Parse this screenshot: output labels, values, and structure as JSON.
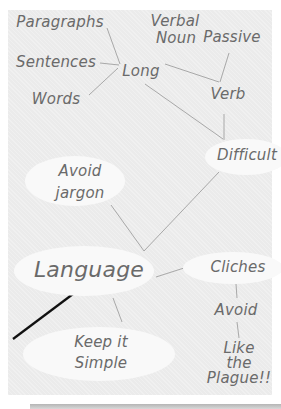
{
  "diagram": {
    "type": "mind-map",
    "central_node": "Language",
    "nodes": {
      "paragraphs": "Paragraphs",
      "sentences": "Sentences",
      "words": "Words",
      "long": "Long",
      "verbal_noun_line1": "Verbal",
      "verbal_noun_line2": "Noun",
      "passive": "Passive",
      "verb": "Verb",
      "difficult": "Difficult",
      "avoid_jargon_line1": "Avoid",
      "avoid_jargon_line2": "jargon",
      "language": "Language",
      "cliches": "Cliches",
      "avoid": "Avoid",
      "keep_simple_line1": "Keep it",
      "keep_simple_line2": "Simple",
      "plague_line1": "Like",
      "plague_line2": "the",
      "plague_line3": "Plague!!"
    },
    "edges": [
      [
        "Paragraphs",
        "Long"
      ],
      [
        "Sentences",
        "Long"
      ],
      [
        "Words",
        "Long"
      ],
      [
        "Long",
        "Difficult"
      ],
      [
        "Verbal Noun",
        "Verb"
      ],
      [
        "Passive",
        "Verb"
      ],
      [
        "Verb",
        "Difficult"
      ],
      [
        "Difficult",
        "Language"
      ],
      [
        "Avoid jargon",
        "Language"
      ],
      [
        "Language",
        "Cliches"
      ],
      [
        "Language",
        "Keep it Simple"
      ],
      [
        "Cliches",
        "Avoid"
      ],
      [
        "Avoid",
        "Like the Plague!!"
      ]
    ],
    "colors": {
      "panel": "#ebebeb",
      "ellipse": "#f9f9f9",
      "text": "#6a6a6a",
      "line": "#a8a8a8",
      "pointer": "#111111"
    }
  }
}
